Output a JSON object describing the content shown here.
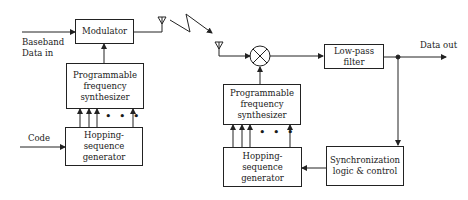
{
  "diagram": {
    "type": "block-diagram",
    "transmitter": {
      "modulator": "Modulator",
      "synthesizer": [
        "Programmable",
        "frequency",
        "synthesizer"
      ],
      "hopping_generator": [
        "Hopping-sequence",
        "generator"
      ],
      "inputs": {
        "baseband": [
          "Baseband",
          "Data in"
        ],
        "code": "Code"
      }
    },
    "receiver": {
      "mixer": "mixer",
      "lowpass": "Low-pass filter",
      "synthesizer": [
        "Programmable",
        "frequency",
        "synthesizer"
      ],
      "hopping_generator": [
        "Hopping-sequence",
        "generator"
      ],
      "sync": [
        "Synchronization",
        "logic & control"
      ],
      "output": "Data out"
    },
    "ellipsis": "• • •"
  },
  "colors": {
    "line": "#222222",
    "background": "#ffffff"
  }
}
